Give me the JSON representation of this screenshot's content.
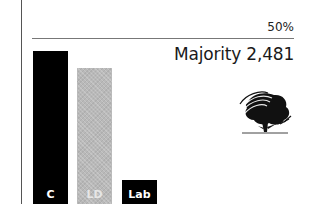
{
  "chart_data": {
    "type": "bar",
    "title": "",
    "categories": [
      "C",
      "LD",
      "Lab"
    ],
    "values": [
      53,
      47,
      8
    ],
    "colors": [
      "#000000",
      "#b9b9b9",
      "#000000"
    ],
    "reference_line": {
      "value": 50,
      "label": "50%"
    },
    "annotation": "Majority 2,481",
    "xlabel": "",
    "ylabel": "",
    "ylim": [
      0,
      55
    ],
    "grid": false,
    "legend": "none"
  },
  "labels": {
    "fifty_pct": "50%",
    "majority": "Majority 2,481"
  },
  "bars": [
    {
      "party": "C",
      "color": "#000000",
      "left": 33,
      "height": 153
    },
    {
      "party": "LD",
      "color": "#b9b9b9",
      "left": 77,
      "height": 136
    },
    {
      "party": "Lab",
      "color": "#000000",
      "left": 122,
      "height": 24
    }
  ],
  "logo": {
    "icon": "conservative-tree-icon"
  }
}
